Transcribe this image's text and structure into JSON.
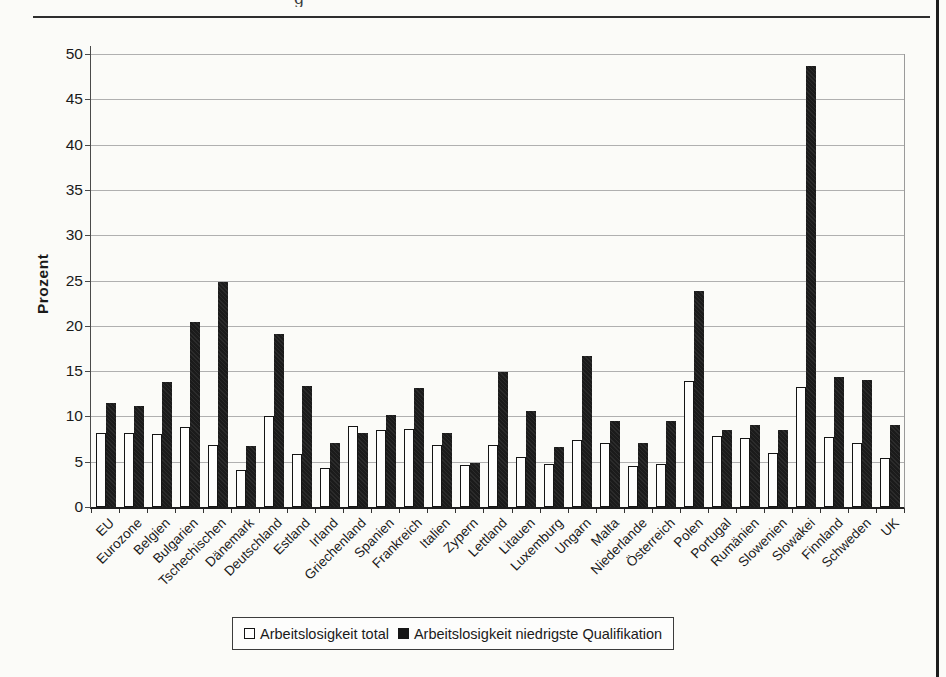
{
  "page": {
    "top_text_fragment": "g"
  },
  "chart_data": {
    "type": "bar",
    "title": "",
    "xlabel": "",
    "ylabel": "Prozent",
    "ylim": [
      0,
      50
    ],
    "ytick_step": 5,
    "grid": true,
    "legend_position": "bottom",
    "categories": [
      "EU",
      "Eurozone",
      "Belgien",
      "Bulgarien",
      "Tschechischen",
      "Dänemark",
      "Deutschland",
      "Estland",
      "Irland",
      "Griechenland",
      "Spanien",
      "Frankreich",
      "Italien",
      "Zypern",
      "Lettland",
      "Litauen",
      "Luxemburg",
      "Ungarn",
      "Malta",
      "Niederlande",
      "Österreich",
      "Polen",
      "Portugal",
      "Rumänien",
      "Slowenien",
      "Slowakei",
      "Finnland",
      "Schweden",
      "UK"
    ],
    "series": [
      {
        "name": "Arbeitslosigkeit total",
        "color": "#ffffff",
        "values": [
          8.2,
          8.2,
          8.1,
          8.8,
          6.9,
          4.1,
          10.1,
          5.9,
          4.3,
          8.9,
          8.5,
          8.6,
          6.8,
          4.6,
          6.9,
          5.5,
          4.7,
          7.4,
          7.1,
          4.5,
          4.8,
          13.9,
          7.8,
          7.6,
          6.0,
          13.3,
          7.7,
          7.1,
          5.4
        ]
      },
      {
        "name": "Arbeitslosigkeit niedrigste Qualifikation",
        "color": "#1b1b1b",
        "values": [
          11.5,
          11.2,
          13.8,
          20.4,
          24.8,
          6.7,
          19.1,
          13.4,
          7.1,
          8.2,
          10.2,
          13.1,
          8.2,
          4.9,
          14.9,
          10.6,
          6.6,
          16.7,
          9.5,
          7.1,
          9.5,
          23.8,
          8.5,
          9.0,
          8.5,
          48.7,
          14.3,
          14.0,
          9.1
        ]
      }
    ]
  }
}
